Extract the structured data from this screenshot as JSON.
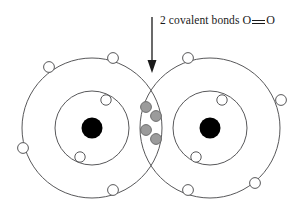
{
  "figure": {
    "background_color": "#ffffff",
    "width": 302,
    "height": 212
  },
  "annotation": {
    "label_prefix": "2 covalent bonds",
    "atom_left_symbol": "O",
    "bond_symbol": "=",
    "bond_symbol_name": "double-bond-glyph",
    "atom_right_symbol": "O",
    "full_text": "2 covalent bonds O = O",
    "pointer": {
      "name": "callout-arrow",
      "direction": "down",
      "x": 152,
      "y_start": 17,
      "y_end": 72,
      "color": "#1a1a1a"
    }
  },
  "colors": {
    "shell_stroke": "#58585a",
    "electron_fill": "#ffffff",
    "electron_stroke": "#58585a",
    "shared_electron_fill": "#9b9b9b",
    "shared_electron_stroke": "#6d6d6d",
    "nucleus_fill": "#000000",
    "text": "#1a1a1a"
  },
  "atoms": [
    {
      "id": "left",
      "element": "O",
      "name": "oxygen-atom-left",
      "nucleus": {
        "cx": 92,
        "cy": 128,
        "r": 10.5
      },
      "shells": [
        {
          "name": "inner-shell",
          "cx": 92,
          "cy": 128,
          "r": 37
        },
        {
          "name": "outer-shell",
          "cx": 92,
          "cy": 128,
          "r": 70
        }
      ],
      "electrons": [
        {
          "name": "electron-inner-1",
          "cx": 106,
          "cy": 100,
          "r": 5.2,
          "shell": "inner"
        },
        {
          "name": "electron-inner-2",
          "cx": 80,
          "cy": 157,
          "r": 5.2,
          "shell": "inner"
        },
        {
          "name": "electron-outer-1",
          "cx": 113,
          "cy": 58,
          "r": 5.4,
          "shell": "outer"
        },
        {
          "name": "electron-outer-2",
          "cx": 49,
          "cy": 67,
          "r": 5.4,
          "shell": "outer"
        },
        {
          "name": "electron-outer-3",
          "cx": 23,
          "cy": 148,
          "r": 5.4,
          "shell": "outer"
        },
        {
          "name": "electron-outer-4",
          "cx": 113,
          "cy": 190,
          "r": 5.4,
          "shell": "outer"
        }
      ]
    },
    {
      "id": "right",
      "element": "O",
      "name": "oxygen-atom-right",
      "nucleus": {
        "cx": 210,
        "cy": 128,
        "r": 10.5
      },
      "shells": [
        {
          "name": "inner-shell",
          "cx": 210,
          "cy": 128,
          "r": 37
        },
        {
          "name": "outer-shell",
          "cx": 210,
          "cy": 128,
          "r": 70
        }
      ],
      "electrons": [
        {
          "name": "electron-inner-1",
          "cx": 222,
          "cy": 100,
          "r": 5.2,
          "shell": "inner"
        },
        {
          "name": "electron-inner-2",
          "cx": 196,
          "cy": 157,
          "r": 5.2,
          "shell": "inner"
        },
        {
          "name": "electron-outer-1",
          "cx": 188,
          "cy": 58,
          "r": 5.4,
          "shell": "outer"
        },
        {
          "name": "electron-outer-2",
          "cx": 281,
          "cy": 100,
          "r": 5.4,
          "shell": "outer"
        },
        {
          "name": "electron-outer-3",
          "cx": 255,
          "cy": 183,
          "r": 5.4,
          "shell": "outer"
        },
        {
          "name": "electron-outer-4",
          "cx": 188,
          "cy": 190,
          "r": 5.4,
          "shell": "outer"
        }
      ]
    }
  ],
  "shared_electrons": {
    "name": "shared-electron-pairs",
    "count": 4,
    "pairs": 2,
    "items": [
      {
        "name": "shared-electron-1",
        "cx": 146,
        "cy": 107,
        "r": 5.4
      },
      {
        "name": "shared-electron-2",
        "cx": 156,
        "cy": 116,
        "r": 5.4
      },
      {
        "name": "shared-electron-3",
        "cx": 146,
        "cy": 130,
        "r": 5.4
      },
      {
        "name": "shared-electron-4",
        "cx": 156,
        "cy": 139,
        "r": 5.4
      }
    ]
  }
}
